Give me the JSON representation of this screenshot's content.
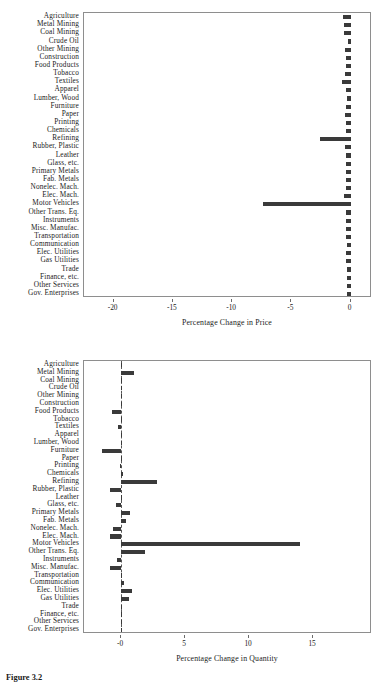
{
  "figure": {
    "caption": "Figure 3.2",
    "categories": [
      "Agriculture",
      "Metal Mining",
      "Coal Mining",
      "Crude Oil",
      "Other Mining",
      "Construction",
      "Food Products",
      "Tobacco",
      "Textiles",
      "Apparel",
      "Lumber, Wood",
      "Furniture",
      "Paper",
      "Printing",
      "Chemicals",
      "Refining",
      "Rubber, Plastic",
      "Leather",
      "Glass, etc.",
      "Primary Metals",
      "Fab. Metals",
      "Nonelec. Mach.",
      "Elec. Mach.",
      "Motor Vehicles",
      "Other Trans. Eq.",
      "Instruments",
      "Misc. Manufac.",
      "Transportation",
      "Communication",
      "Elec. Utilities",
      "Gas Utilities",
      "Trade",
      "Finance, etc.",
      "Other Services",
      "Gov. Enterprises"
    ]
  },
  "chart_data": [
    {
      "type": "bar",
      "orientation": "horizontal",
      "title": "",
      "xlabel": "Percentage Change in Price",
      "ylabel": "",
      "xlim": [
        -22.5,
        1.8
      ],
      "xticks": [
        -20,
        -15,
        -10,
        -5,
        0
      ],
      "xticklabels": [
        "-20",
        "-15",
        "-10",
        "-5",
        "0"
      ],
      "grid": false,
      "legend": "none",
      "zero_line": false,
      "bar_color": "#3a3a3a",
      "categories": [
        "Agriculture",
        "Metal Mining",
        "Coal Mining",
        "Crude Oil",
        "Other Mining",
        "Construction",
        "Food Products",
        "Tobacco",
        "Textiles",
        "Apparel",
        "Lumber, Wood",
        "Furniture",
        "Paper",
        "Printing",
        "Chemicals",
        "Refining",
        "Rubber, Plastic",
        "Leather",
        "Glass, etc.",
        "Primary Metals",
        "Fab. Metals",
        "Nonelec. Mach.",
        "Elec. Mach.",
        "Motor Vehicles",
        "Other Trans. Eq.",
        "Instruments",
        "Misc. Manufac.",
        "Transportation",
        "Communication",
        "Elec. Utilities",
        "Gas Utilities",
        "Trade",
        "Finance, etc.",
        "Other Services",
        "Gov. Enterprises"
      ],
      "values": [
        -0.62,
        -0.55,
        -0.58,
        -0.22,
        -0.45,
        -0.42,
        -0.4,
        -0.5,
        -0.72,
        -0.42,
        -0.3,
        -0.38,
        -0.45,
        -0.4,
        -0.42,
        -2.55,
        -0.45,
        -0.4,
        -0.42,
        -0.4,
        -0.38,
        -0.42,
        -0.55,
        -7.4,
        -0.42,
        -0.38,
        -0.4,
        -0.42,
        -0.35,
        -0.42,
        -0.4,
        -0.35,
        -0.3,
        -0.32,
        -0.35
      ]
    },
    {
      "type": "bar",
      "orientation": "horizontal",
      "title": "",
      "xlabel": "Percentage Change in Quantity",
      "ylabel": "",
      "xlim": [
        -2.9,
        19.6
      ],
      "xticks": [
        0,
        5,
        10,
        15
      ],
      "xticklabels": [
        "-0",
        "5",
        "10",
        "15"
      ],
      "grid": false,
      "legend": "none",
      "zero_line": true,
      "bar_color": "#3a3a3a",
      "categories": [
        "Agriculture",
        "Metal Mining",
        "Coal Mining",
        "Crude Oil",
        "Other Mining",
        "Construction",
        "Food Products",
        "Tobacco",
        "Textiles",
        "Apparel",
        "Lumber, Wood",
        "Furniture",
        "Paper",
        "Printing",
        "Chemicals",
        "Refining",
        "Rubber, Plastic",
        "Leather",
        "Glass, etc.",
        "Primary Metals",
        "Fab. Metals",
        "Nonelec. Mach.",
        "Elec. Mach.",
        "Motor Vehicles",
        "Other Trans. Eq.",
        "Instruments",
        "Misc. Manufac.",
        "Transportation",
        "Communication",
        "Elec. Utilities",
        "Gas Utilities",
        "Trade",
        "Finance, etc.",
        "Other Services",
        "Gov. Enterprises"
      ],
      "values": [
        0.05,
        1.0,
        0.05,
        0.02,
        0.03,
        0.04,
        -0.7,
        0.03,
        -0.25,
        0.03,
        0.02,
        -1.5,
        0.05,
        -0.1,
        0.12,
        2.8,
        -0.9,
        0.02,
        -0.4,
        0.7,
        0.4,
        -0.6,
        -0.9,
        14.0,
        1.9,
        -0.35,
        -0.85,
        0.05,
        0.2,
        0.85,
        0.6,
        0.04,
        0.05,
        0.03,
        0.04
      ]
    }
  ]
}
